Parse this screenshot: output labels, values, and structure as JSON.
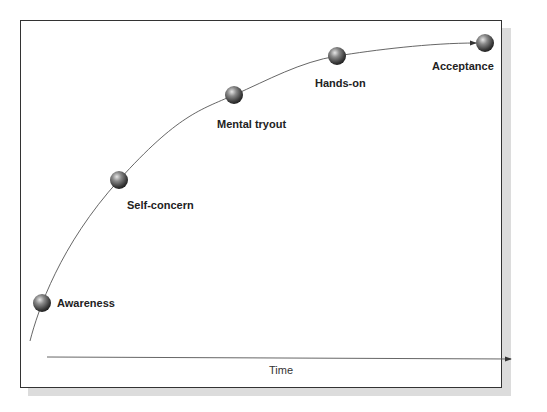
{
  "diagram": {
    "type": "adoption-curve",
    "stages": [
      {
        "label": "Awareness",
        "x": 42,
        "y": 303,
        "label_x": 57,
        "label_y": 297
      },
      {
        "label": "Self-concern",
        "x": 119,
        "y": 180,
        "label_x": 127,
        "label_y": 199
      },
      {
        "label": "Mental tryout",
        "x": 234,
        "y": 95,
        "label_x": 217,
        "label_y": 118
      },
      {
        "label": "Hands-on",
        "x": 337,
        "y": 56,
        "label_x": 315,
        "label_y": 77
      },
      {
        "label": "Acceptance",
        "x": 485,
        "y": 43,
        "label_x": 432,
        "label_y": 60
      }
    ],
    "x_axis_label": "Time",
    "colors": {
      "frame": "#333333",
      "shadow": "#dcdcdc",
      "line": "#555555",
      "ball": "#4a4a4a"
    }
  }
}
